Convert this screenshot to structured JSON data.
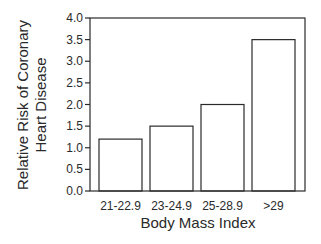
{
  "chart_data": {
    "type": "bar",
    "title": "",
    "xlabel": "Body Mass Index",
    "ylabel_lines": [
      "Relative Risk of Coronary",
      "Heart Disease"
    ],
    "ylabel": "Relative Risk of Coronary Heart Disease",
    "categories": [
      "21-22.9",
      "23-24.9",
      "25-28.9",
      ">29"
    ],
    "values": [
      1.2,
      1.5,
      2.0,
      3.5
    ],
    "ylim": [
      0,
      4.0
    ],
    "yticks": [
      "0.0",
      "0.5",
      "1.0",
      "1.5",
      "2.0",
      "2.5",
      "3.0",
      "3.5",
      "4.0"
    ],
    "grid": false,
    "legend": null,
    "bar_fill": "#ffffff",
    "bar_stroke": "#2a2a2a"
  }
}
